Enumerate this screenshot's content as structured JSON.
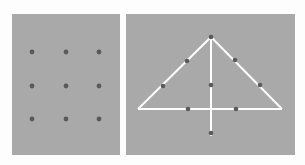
{
  "figure": {
    "background": "#fdfdfd",
    "panel_color": "#a9a9a9",
    "dot_color": "#5a5a5a",
    "line_color": "#ffffff"
  },
  "left_panel": {
    "description": "3x3 grid of nine dots",
    "dots": [
      {
        "x": 32,
        "y": 52
      },
      {
        "x": 66,
        "y": 52
      },
      {
        "x": 99,
        "y": 52
      },
      {
        "x": 32,
        "y": 86
      },
      {
        "x": 66,
        "y": 86
      },
      {
        "x": 99,
        "y": 86
      },
      {
        "x": 32,
        "y": 119
      },
      {
        "x": 66,
        "y": 119
      },
      {
        "x": 99,
        "y": 119
      }
    ]
  },
  "right_panel": {
    "description": "nine-dot puzzle solution: triangle with vertical line through apex",
    "lines": [
      {
        "x1": 211,
        "y1": 37,
        "x2": 138,
        "y2": 109
      },
      {
        "x1": 211,
        "y1": 37,
        "x2": 282,
        "y2": 109
      },
      {
        "x1": 138,
        "y1": 109,
        "x2": 282,
        "y2": 109
      },
      {
        "x1": 211,
        "y1": 37,
        "x2": 211,
        "y2": 136
      }
    ],
    "dots": [
      {
        "x": 211,
        "y": 37
      },
      {
        "x": 187,
        "y": 61
      },
      {
        "x": 235,
        "y": 60
      },
      {
        "x": 163,
        "y": 86
      },
      {
        "x": 211,
        "y": 85
      },
      {
        "x": 260,
        "y": 85
      },
      {
        "x": 188,
        "y": 109
      },
      {
        "x": 236,
        "y": 109
      },
      {
        "x": 211,
        "y": 133
      }
    ]
  }
}
